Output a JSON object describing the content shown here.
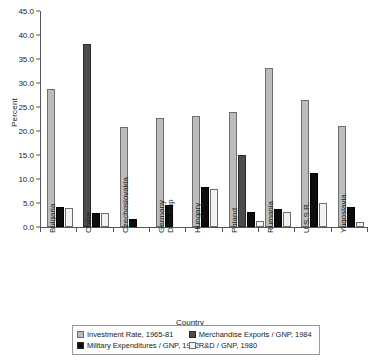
{
  "chart_data": {
    "type": "bar",
    "title": "",
    "xlabel": "Country",
    "ylabel": "Percent",
    "ylim": [
      0.0,
      45.0
    ],
    "ytick_step": 5.0,
    "ytick_labels": [
      "45.0",
      "40.0",
      "35.0",
      "30.0",
      "25.0",
      "20.0",
      "15.0",
      "10.0",
      "5.0",
      "0.0"
    ],
    "grid": false,
    "legend_position": "bottom",
    "categories": [
      "Bulgaria",
      "China",
      "Czechoslovakia",
      "Germany Dem Rep",
      "Hungary",
      "Poland",
      "Rumania",
      "U.S.S.R.",
      "Yugoslavia"
    ],
    "category_lines": [
      [
        "Bulgaria"
      ],
      [
        "China"
      ],
      [
        "Czechoslovakia"
      ],
      [
        "Germany",
        "Dem Rep"
      ],
      [
        "Hungary"
      ],
      [
        "Poland"
      ],
      [
        "Rumania"
      ],
      [
        "U.S.S.R."
      ],
      [
        "Yugoslavia"
      ]
    ],
    "series": [
      {
        "name": "Investment Rate, 1965-81",
        "color": "#bcbcbc",
        "values": [
          28.8,
          0,
          20.8,
          22.8,
          23.2,
          24.0,
          33.2,
          26.5,
          21.0
        ]
      },
      {
        "name": "Merchandise Exports / GNP, 1984",
        "color": "#4c4c4c",
        "values": [
          0,
          38.1,
          0,
          0,
          0,
          15.0,
          0,
          0,
          0
        ]
      },
      {
        "name": "Military Expenditures / GNP, 1982",
        "color": "#0d0d0d",
        "values": [
          4.2,
          2.9,
          1.7,
          4.6,
          8.3,
          3.1,
          3.7,
          11.2,
          4.1
        ]
      },
      {
        "name": "R&D / GNP, 1980",
        "color": "#f2f2f2",
        "values": [
          3.9,
          3.0,
          0,
          0,
          8.0,
          1.3,
          3.2,
          5.0,
          1.0
        ]
      }
    ]
  }
}
